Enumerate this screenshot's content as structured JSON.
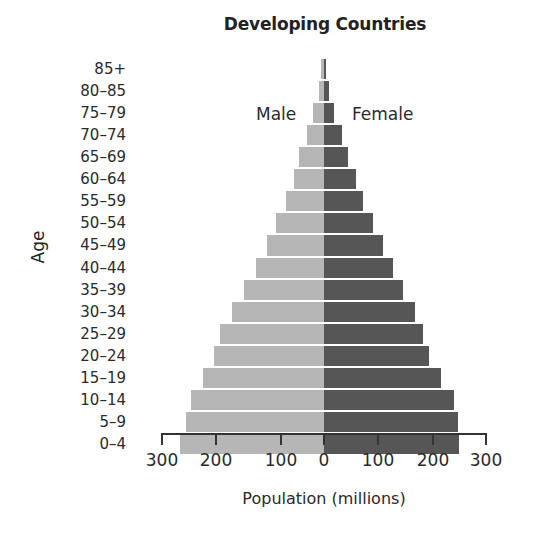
{
  "chart_data": {
    "type": "bar",
    "subtype": "population-pyramid",
    "title": "Developing Countries",
    "xlabel": "Population (millions)",
    "ylabel": "Age",
    "categories": [
      "85+",
      "80–85",
      "75–79",
      "70–74",
      "65–69",
      "60–64",
      "55–59",
      "50–54",
      "45–49",
      "40–44",
      "35–39",
      "30–34",
      "25–29",
      "20–24",
      "15–19",
      "10–14",
      "5–9",
      "0–4"
    ],
    "series": [
      {
        "name": "Male",
        "color": "#b6b6b6",
        "side": "left",
        "values": [
          6,
          10,
          20,
          32,
          46,
          56,
          70,
          89,
          106,
          126,
          148,
          170,
          193,
          204,
          224,
          246,
          256,
          267
        ]
      },
      {
        "name": "Female",
        "color": "#565656",
        "side": "right",
        "values": [
          3,
          9,
          19,
          33,
          45,
          59,
          72,
          91,
          109,
          128,
          146,
          169,
          183,
          194,
          217,
          241,
          248,
          250
        ]
      }
    ],
    "x_ticks": [
      "300",
      "200",
      "100",
      "0",
      "100",
      "200",
      "300"
    ],
    "xlim": [
      -300,
      300
    ],
    "grid": false,
    "legend": {
      "entries": [
        "Male",
        "Female"
      ],
      "position": "inside-top"
    }
  },
  "labels": {
    "title": "Developing Countries",
    "age": "Age",
    "male": "Male",
    "female": "Female",
    "x_title": "Population (millions)"
  }
}
